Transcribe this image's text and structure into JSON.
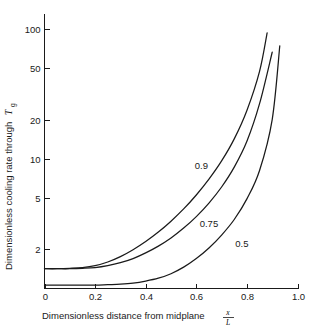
{
  "chart_data": {
    "type": "line",
    "title": "",
    "xlabel": "Dimensionless distance from midplane x/L",
    "xlabel_text": "Dimensionless distance from midplane",
    "xlabel_fraction_numerator": "x",
    "xlabel_fraction_denominator": "L",
    "ylabel": "Dimensionless cooling rate through Tg",
    "ylabel_text": "Dimensionless cooling rate through",
    "ylabel_symbol": "T",
    "ylabel_symbol_subscript": "g",
    "yscale": "log",
    "xscale": "linear",
    "xlim": [
      0.0,
      1.0
    ],
    "ylim": [
      1.0,
      130
    ],
    "grid": false,
    "legend_position": "inline-curve-labels",
    "xticks": [
      "0",
      "0.2",
      "0.4",
      "0.6",
      "0.8",
      "1.0"
    ],
    "xtick_values": [
      0.0,
      0.2,
      0.4,
      0.6,
      0.8,
      1.0
    ],
    "yticks": [
      "2",
      "5",
      "10",
      "20",
      "50",
      "100"
    ],
    "ytick_values": [
      2,
      5,
      10,
      20,
      50,
      100
    ],
    "series": [
      {
        "name": "0.9",
        "label": "0.9",
        "label_x": 0.62,
        "label_y": 8.3,
        "x": [
          0.0,
          0.05,
          0.1,
          0.15,
          0.2,
          0.25,
          0.3,
          0.35,
          0.4,
          0.45,
          0.5,
          0.55,
          0.6,
          0.65,
          0.7,
          0.75,
          0.8,
          0.85,
          0.88
        ],
        "values": [
          1.42,
          1.42,
          1.43,
          1.45,
          1.5,
          1.6,
          1.76,
          1.99,
          2.3,
          2.72,
          3.3,
          4.1,
          5.25,
          6.95,
          9.6,
          14.2,
          23.5,
          47.0,
          93.0
        ]
      },
      {
        "name": "0.75",
        "label": "0.75",
        "label_x": 0.65,
        "label_y": 2.95,
        "x": [
          0.0,
          0.05,
          0.1,
          0.15,
          0.2,
          0.25,
          0.3,
          0.35,
          0.4,
          0.45,
          0.5,
          0.55,
          0.6,
          0.65,
          0.7,
          0.75,
          0.8,
          0.85,
          0.9
        ],
        "values": [
          1.42,
          1.42,
          1.42,
          1.43,
          1.45,
          1.5,
          1.58,
          1.7,
          1.88,
          2.12,
          2.45,
          2.92,
          3.58,
          4.55,
          6.05,
          8.6,
          13.6,
          26.5,
          66.0
        ]
      },
      {
        "name": "0.5",
        "label": "0.5",
        "label_x": 0.78,
        "label_y": 2.07,
        "x": [
          0.0,
          0.05,
          0.1,
          0.15,
          0.2,
          0.25,
          0.3,
          0.35,
          0.4,
          0.45,
          0.5,
          0.55,
          0.6,
          0.65,
          0.7,
          0.75,
          0.8,
          0.85,
          0.9,
          0.93
        ],
        "values": [
          1.06,
          1.06,
          1.06,
          1.06,
          1.06,
          1.07,
          1.08,
          1.1,
          1.14,
          1.2,
          1.3,
          1.46,
          1.7,
          2.05,
          2.58,
          3.4,
          4.9,
          8.1,
          20.0,
          74.0
        ]
      }
    ]
  }
}
